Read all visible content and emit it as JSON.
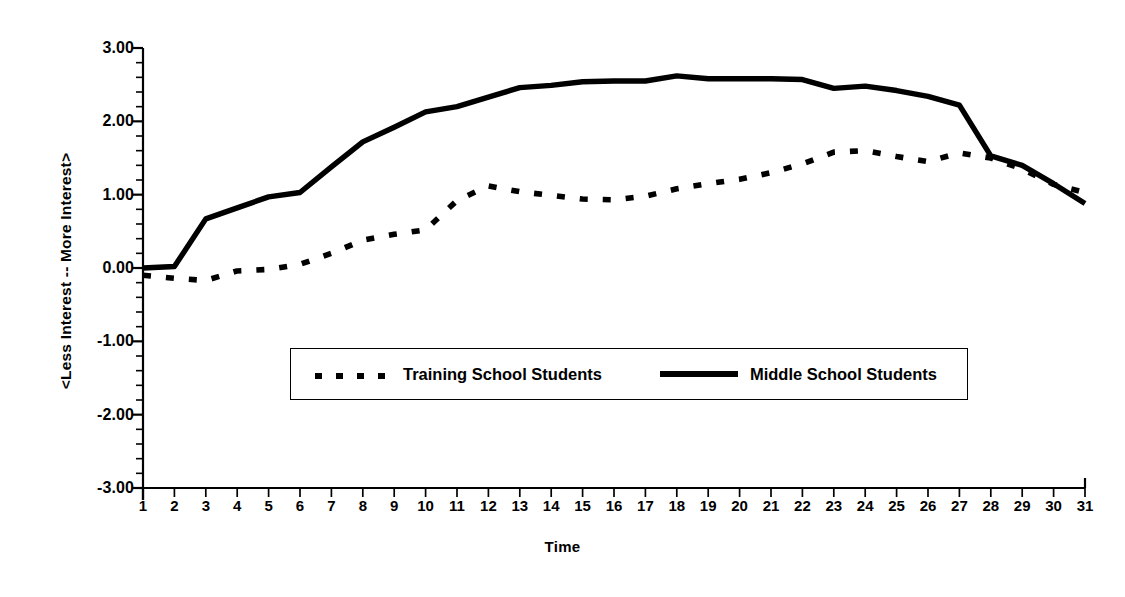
{
  "chart_data": {
    "type": "line",
    "title": "",
    "xlabel": "Time",
    "ylabel": "<Less Interest  --  More Interest>",
    "xlim": [
      1,
      31
    ],
    "ylim": [
      -3.0,
      3.0
    ],
    "ytick_labels": [
      "3.00",
      "2.00",
      "1.00",
      "0.00",
      "-1.00",
      "-2.00",
      "-3.00"
    ],
    "ytick_values": [
      3,
      2,
      1,
      0,
      -1,
      -2,
      -3
    ],
    "yminor_step": 0.2,
    "grid": false,
    "legend_position": "center",
    "x": [
      1,
      2,
      3,
      4,
      5,
      6,
      7,
      8,
      9,
      10,
      11,
      12,
      13,
      14,
      15,
      16,
      17,
      18,
      19,
      20,
      21,
      22,
      23,
      24,
      25,
      26,
      27,
      28,
      29,
      30,
      31
    ],
    "xtick_labels": [
      "1",
      "2",
      "3",
      "4",
      "5",
      "6",
      "7",
      "8",
      "9",
      "10",
      "11",
      "12",
      "13",
      "14",
      "15",
      "16",
      "17",
      "18",
      "19",
      "20",
      "21",
      "22",
      "23",
      "24",
      "25",
      "26",
      "27",
      "28",
      "29",
      "30",
      "31"
    ],
    "series": [
      {
        "name": "Training School Students",
        "style": "dotted",
        "color": "#000000",
        "values": [
          -0.1,
          -0.14,
          -0.17,
          -0.04,
          -0.02,
          0.05,
          0.2,
          0.38,
          0.46,
          0.52,
          0.92,
          1.12,
          1.04,
          0.99,
          0.94,
          0.93,
          0.98,
          1.08,
          1.15,
          1.21,
          1.3,
          1.42,
          1.58,
          1.6,
          1.52,
          1.45,
          1.57,
          1.5,
          1.35,
          1.14,
          1.03
        ]
      },
      {
        "name": "Middle School Students",
        "style": "solid",
        "color": "#000000",
        "values": [
          0.0,
          0.02,
          0.67,
          0.82,
          0.97,
          1.03,
          1.38,
          1.72,
          1.92,
          2.13,
          2.2,
          2.33,
          2.46,
          2.49,
          2.54,
          2.55,
          2.55,
          2.62,
          2.58,
          2.58,
          2.58,
          2.57,
          2.45,
          2.48,
          2.42,
          2.34,
          2.22,
          1.53,
          1.4,
          1.15,
          0.88
        ]
      }
    ]
  }
}
